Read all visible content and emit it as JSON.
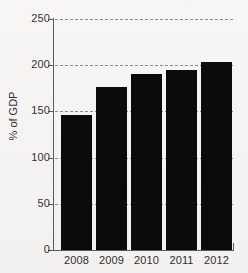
{
  "chart_data": {
    "type": "bar",
    "title": "",
    "subtitle": "",
    "categories": [
      "2008",
      "2009",
      "2010",
      "2011",
      "2012"
    ],
    "values": [
      146,
      176,
      191,
      195,
      204
    ],
    "series": [
      {
        "name": "% of GDP",
        "values": [
          146,
          176,
          191,
          195,
          204
        ]
      }
    ],
    "xlabel": "",
    "ylabel": "% of GDP",
    "ylim": [
      0,
      250
    ],
    "yticks": [
      0,
      50,
      100,
      150,
      200,
      250
    ],
    "ytick_labels": [
      "0",
      "50",
      "100",
      "150",
      "200",
      "250"
    ],
    "grid": "horizontal-dashed",
    "legend": "none",
    "bar_color": "#0b0b0b",
    "grid_color": "#8c8c8c",
    "axis_color": "#5b5b5b",
    "background_color": "#f6f5f3"
  },
  "axis": {
    "y_title": "% of GDP"
  }
}
